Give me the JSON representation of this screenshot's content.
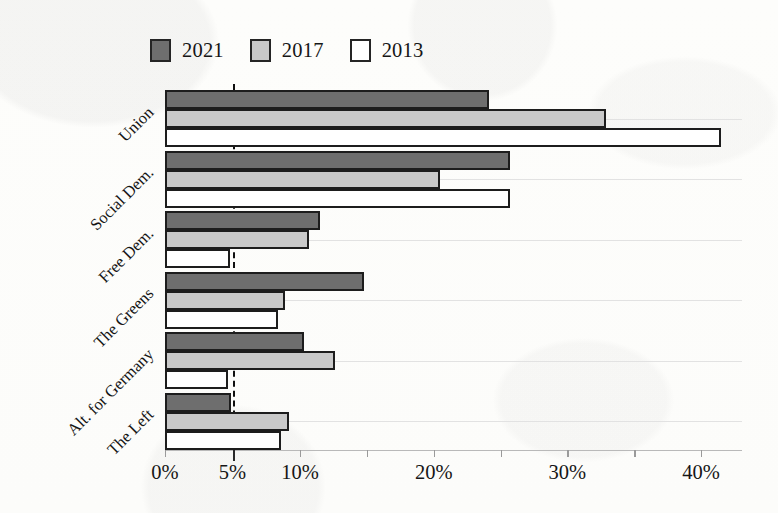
{
  "legend": {
    "entries": [
      {
        "label": "2021",
        "color": "#6e6e6e"
      },
      {
        "label": "2017",
        "color": "#c9c9c9"
      },
      {
        "label": "2013",
        "color": "#ffffff"
      }
    ]
  },
  "axis": {
    "ticklabels": [
      "0%",
      "5%",
      "10%",
      "20%",
      "30%",
      "40%"
    ],
    "tickvalues": [
      0,
      5,
      10,
      20,
      30,
      40
    ]
  },
  "chart_data": {
    "type": "bar",
    "orientation": "horizontal",
    "grouped": true,
    "title": "",
    "xlabel": "",
    "ylabel": "",
    "xlim": [
      0,
      43
    ],
    "grid": "horizontal-faint",
    "legend_position": "top-left",
    "categories": [
      "Union",
      "Social Dem.",
      "Free Dem.",
      "The Greens",
      "Alt. for Germany",
      "The Left"
    ],
    "series": [
      {
        "name": "2021",
        "color": "#6e6e6e",
        "values": [
          24.1,
          25.7,
          11.5,
          14.8,
          10.3,
          4.9
        ]
      },
      {
        "name": "2017",
        "color": "#c9c9c9",
        "values": [
          32.9,
          20.5,
          10.7,
          8.9,
          12.6,
          9.2
        ]
      },
      {
        "name": "2013",
        "color": "#ffffff",
        "values": [
          41.5,
          25.7,
          4.8,
          8.4,
          4.7,
          8.6
        ]
      }
    ],
    "annotations": [
      {
        "type": "vline",
        "value": 5,
        "style": "dashed",
        "label": "5% electoral threshold"
      }
    ],
    "axis_note": "Non-linear x axis: the 0-10% span is drawn wider than each subsequent 10% span."
  }
}
